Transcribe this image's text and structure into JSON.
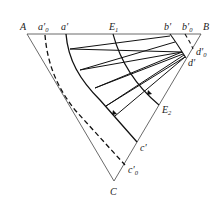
{
  "diagram": {
    "type": "ternary-phase-diagram",
    "vertices": {
      "top_left": "A",
      "top_right": "B",
      "bottom": "C"
    },
    "labels": [
      {
        "id": "a0",
        "base": "a",
        "prime": "′",
        "sub": "0"
      },
      {
        "id": "a1",
        "base": "a",
        "prime": "′",
        "sub": ""
      },
      {
        "id": "E1",
        "base": "E",
        "prime": "",
        "sub": "1"
      },
      {
        "id": "b1",
        "base": "b",
        "prime": "′",
        "sub": ""
      },
      {
        "id": "b0",
        "base": "b",
        "prime": "′",
        "sub": "0"
      },
      {
        "id": "d0",
        "base": "d",
        "prime": "′",
        "sub": "0"
      },
      {
        "id": "d1",
        "base": "d",
        "prime": "′",
        "sub": ""
      },
      {
        "id": "E2",
        "base": "E",
        "prime": "",
        "sub": "2"
      },
      {
        "id": "c1",
        "base": "c",
        "prime": "′",
        "sub": ""
      },
      {
        "id": "c0",
        "base": "c",
        "prime": "′",
        "sub": "0"
      }
    ],
    "tie_line_count": 7,
    "colors": {
      "line": "#111111",
      "thin": "#444444"
    }
  }
}
